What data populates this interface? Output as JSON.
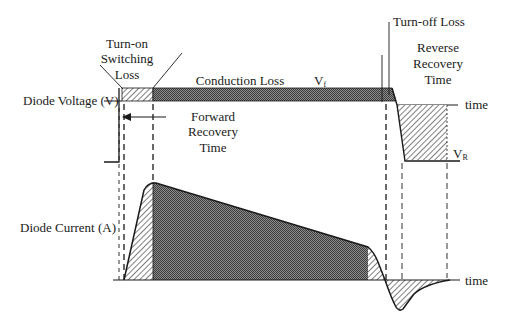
{
  "diagram": {
    "colors": {
      "background": "#ffffff",
      "line": "#1a1a1a",
      "dense_fill": "#5a5a5a",
      "hatch": "#3a3a3a"
    },
    "labels": {
      "turn_on": [
        "Turn-on",
        "Switching",
        "Loss"
      ],
      "conduction_loss": "Conduction Loss",
      "vf_main": "V",
      "vf_sub": "f",
      "turn_off_loss": "Turn-off Loss",
      "reverse_recovery": [
        "Reverse",
        "Recovery",
        "Time"
      ],
      "diode_voltage": "Diode Voltage (V)",
      "forward_recovery": [
        "Forward",
        "Recovery",
        "Time"
      ],
      "vr_main": "V",
      "vr_sub": "R",
      "diode_current": "Diode Current (A)",
      "time_axis_voltage": "time",
      "time_axis_current": "time"
    },
    "legend_fills": {
      "hatched": "Switching loss regions (turn-on / turn-off / reverse recovery)",
      "dotted": "Conduction loss region"
    }
  }
}
